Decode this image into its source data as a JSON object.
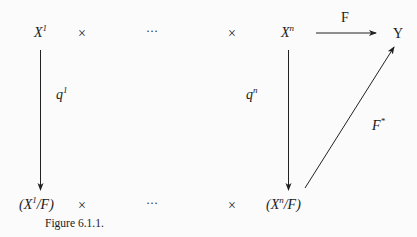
{
  "diagram": {
    "top_row": {
      "x1": {
        "base": "X",
        "sup": "1"
      },
      "times1": "×",
      "dots": "···",
      "times2": "×",
      "xn": {
        "base": "X",
        "sup": "n"
      },
      "y": "Y"
    },
    "bottom_row": {
      "x1f": {
        "open": "(X",
        "sup": "1",
        "close": "/F)"
      },
      "times1": "×",
      "dots": "···",
      "times2": "×",
      "xnf": {
        "open": "(X",
        "sup": "n",
        "close": "/F)"
      }
    },
    "arrows": {
      "f": {
        "label": "F",
        "from": "X^n",
        "to": "Y"
      },
      "q1": {
        "label_base": "q",
        "label_sup": "1",
        "from": "X^1",
        "to": "(X^1/F)"
      },
      "qn": {
        "label_base": "q",
        "label_sup": "n",
        "from": "X^n",
        "to": "(X^n/F)"
      },
      "fstar": {
        "label_base": "F",
        "label_sup": "*",
        "from": "(X^n/F)",
        "to": "Y"
      }
    },
    "caption": "Figure 6.1.1."
  }
}
